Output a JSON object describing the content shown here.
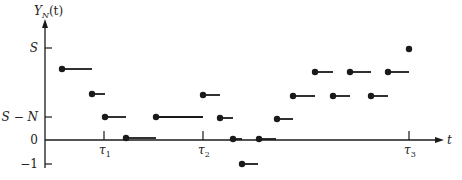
{
  "diagram": {
    "y_axis_label": "Y",
    "y_axis_label_sub": "N",
    "y_axis_label_arg": "(t)",
    "x_axis_label": "t",
    "y_ticks": [
      {
        "label": "S",
        "y": 48
      },
      {
        "label": "S − N",
        "y": 117
      },
      {
        "label": "0",
        "y": 140
      },
      {
        "label": "−1",
        "y": 164
      }
    ],
    "x_ticks": [
      {
        "label": "τ",
        "sub": "1",
        "x": 104
      },
      {
        "label": "τ",
        "sub": "2",
        "x": 203
      },
      {
        "label": "τ",
        "sub": "3",
        "x": 409
      }
    ],
    "colors": {
      "ink": "#1a1a1a"
    }
  },
  "chart_data": {
    "type": "step",
    "title": "",
    "xlabel": "t",
    "ylabel": "Y_N(t)",
    "y_levels": [
      "-1",
      "0",
      "S-N",
      "S"
    ],
    "x_markers": [
      "τ1",
      "τ2",
      "τ3"
    ],
    "segments_px": [
      {
        "x1": 62,
        "x2": 92,
        "y": 69
      },
      {
        "x1": 92,
        "x2": 105,
        "y": 94
      },
      {
        "x1": 105,
        "x2": 126,
        "y": 117
      },
      {
        "x1": 126,
        "x2": 156,
        "y": 138
      },
      {
        "x1": 156,
        "x2": 203,
        "y": 117
      },
      {
        "x1": 203,
        "x2": 220,
        "y": 95
      },
      {
        "x1": 220,
        "x2": 233,
        "y": 118
      },
      {
        "x1": 233,
        "x2": 242,
        "y": 139
      },
      {
        "x1": 242,
        "x2": 258,
        "y": 164
      },
      {
        "x1": 259,
        "x2": 276,
        "y": 139
      },
      {
        "x1": 277,
        "x2": 293,
        "y": 119
      },
      {
        "x1": 293,
        "x2": 315,
        "y": 96
      },
      {
        "x1": 315,
        "x2": 333,
        "y": 72
      },
      {
        "x1": 333,
        "x2": 350,
        "y": 96
      },
      {
        "x1": 350,
        "x2": 371,
        "y": 72
      },
      {
        "x1": 371,
        "x2": 388,
        "y": 96
      },
      {
        "x1": 388,
        "x2": 409,
        "y": 72
      }
    ],
    "final_point_px": {
      "x": 409,
      "y": 49
    },
    "grid": false
  }
}
